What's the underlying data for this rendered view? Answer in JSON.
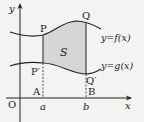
{
  "diagram": {
    "type": "area-between-curves",
    "colors": {
      "background": "#f3f3f1",
      "ink": "#222222",
      "region_fill": "#d6d6d6"
    },
    "axes": {
      "x_label": "x",
      "y_label": "y",
      "origin_label": "O"
    },
    "curves": [
      {
        "name": "upper",
        "label": "y=f(x)"
      },
      {
        "name": "lower",
        "label": "y=g(x)"
      }
    ],
    "points": {
      "P": "P",
      "Q": "Q",
      "P_prime": "P′",
      "Q_prime": "Q′",
      "A": "A",
      "B": "B"
    },
    "x_ticks": {
      "a": "a",
      "b": "b"
    },
    "region_label": "S"
  }
}
